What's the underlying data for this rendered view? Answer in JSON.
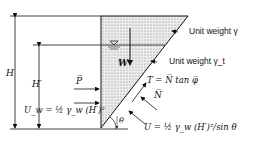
{
  "diagram": {
    "labels": {
      "H": "H",
      "H_prime": "H′",
      "W": "W",
      "P": "P̅",
      "U_w": "U_w = ½ γ_w (H′)²",
      "unit_weight_gamma": "Unit weight γ",
      "unit_weight_gamma_t": "Unit weight γ_t",
      "T": "T = N̅ tan φ̅",
      "N": "N̅",
      "U": "U = ½ γ_w (H′)²/sin θ",
      "theta": "θ",
      "water_symbol": "▽"
    },
    "colors": {
      "line": "#111111",
      "fill": "#d9d9d9"
    }
  }
}
